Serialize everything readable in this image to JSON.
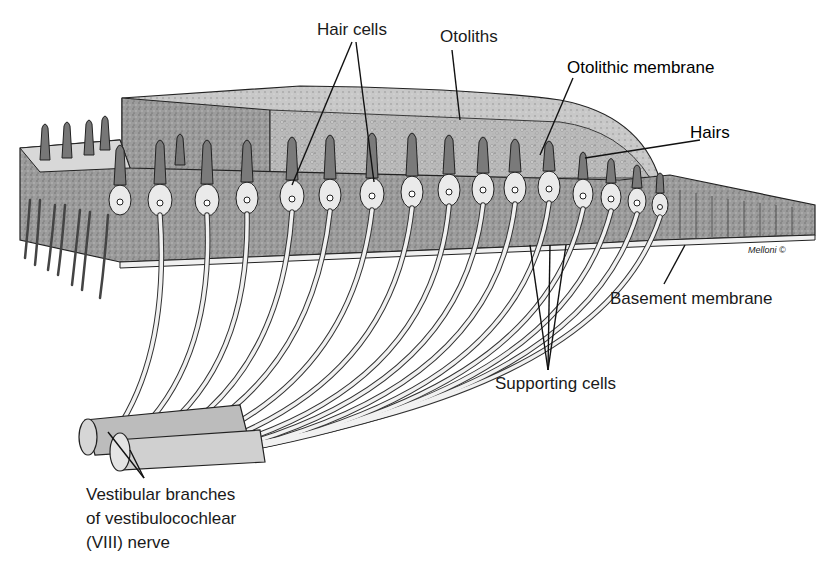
{
  "figure": {
    "labels": {
      "hair_cells": "Hair cells",
      "otoliths": "Otoliths",
      "otolithic_membrane": "Otolithic membrane",
      "hairs": "Hairs",
      "basement_membrane": "Basement membrane",
      "supporting_cells": "Supporting cells",
      "nerve_line1": "Vestibular branches",
      "nerve_line2": "of vestibulocochlear",
      "nerve_line3": "(VIII) nerve"
    },
    "signature": "Melloni ©",
    "colors": {
      "background": "#ffffff",
      "ink": "#1a1a1a",
      "tissue_dark": "#8a8a8a",
      "tissue_mid": "#a8a8a8",
      "tissue_light": "#d0d0d0",
      "fiber": "#e8e8e8"
    }
  }
}
